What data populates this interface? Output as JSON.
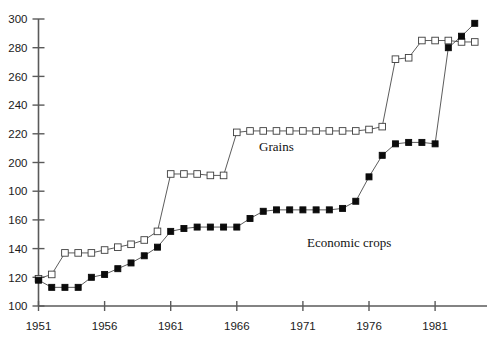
{
  "chart_data": {
    "type": "line",
    "title": "",
    "subtitle": "",
    "xlabel": "",
    "ylabel": "",
    "xlim": [
      1951,
      1984
    ],
    "ylim": [
      100,
      300
    ],
    "grid": false,
    "legend_position": "inline-annotations",
    "y_ticks": [
      100,
      120,
      140,
      160,
      "100",
      200,
      220,
      240,
      260,
      280,
      300
    ],
    "y_tick_values": [
      100,
      120,
      140,
      160,
      180,
      200,
      220,
      240,
      260,
      280,
      300
    ],
    "y_tick_note": "The 180 gridline is labelled '100' in the source image; reproduced verbatim.",
    "x_ticks": [
      1951,
      1956,
      1961,
      1966,
      1971,
      1976,
      1981
    ],
    "x": [
      1951,
      1952,
      1953,
      1954,
      1955,
      1956,
      1957,
      1958,
      1959,
      1960,
      1961,
      1962,
      1963,
      1964,
      1965,
      1966,
      1967,
      1968,
      1969,
      1970,
      1971,
      1972,
      1973,
      1974,
      1975,
      1976,
      1977,
      1978,
      1979,
      1980,
      1981,
      1982,
      1983,
      1984
    ],
    "series": [
      {
        "name": "Grains",
        "marker": "open-square",
        "color": "#ffffff",
        "edge_color": "#3d3d3d",
        "label_x": 1969,
        "label_y": 208,
        "values": [
          119,
          122,
          137,
          137,
          137,
          139,
          141,
          143,
          146,
          152,
          192,
          192,
          192,
          191,
          191,
          221,
          222,
          222,
          222,
          222,
          222,
          222,
          222,
          222,
          222,
          223,
          225,
          272,
          273,
          285,
          285,
          285,
          284,
          284
        ]
      },
      {
        "name": "Economic crops",
        "marker": "filled-square",
        "color": "#0b0b0b",
        "edge_color": "#0b0b0b",
        "label_x": 1974,
        "label_y": 141,
        "values": [
          118,
          113,
          113,
          113,
          120,
          122,
          126,
          130,
          135,
          141,
          152,
          154,
          155,
          155,
          155,
          155,
          161,
          166,
          167,
          167,
          167,
          167,
          167,
          168,
          173,
          190,
          205,
          213,
          214,
          214,
          213,
          280,
          288,
          297
        ]
      }
    ],
    "annotations": [
      {
        "text": "Grains",
        "x": 1969,
        "y": 208
      },
      {
        "text": "Economic crops",
        "x": 1974.5,
        "y": 141
      }
    ]
  },
  "colors": {
    "axis": "#5a5a5a",
    "text": "#1a1a1a",
    "line": "#4a4a4a",
    "open_marker_fill": "#ffffff",
    "filled_marker": "#0b0b0b",
    "background": "#ffffff"
  }
}
